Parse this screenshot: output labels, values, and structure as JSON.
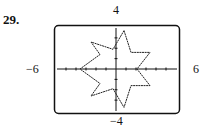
{
  "problem_number": "29.",
  "window": {
    "xmin": "−6",
    "xmax": "6",
    "ymin": "−4",
    "ymax": "4"
  },
  "chart_data": {
    "type": "line",
    "title": "",
    "xlabel": "",
    "ylabel": "",
    "xlim": [
      -6,
      6
    ],
    "ylim": [
      -4,
      4
    ],
    "tick_labels": {
      "left": "-6",
      "right": "6",
      "top": "4",
      "bottom": "-4"
    },
    "grid": false,
    "series": [
      {
        "name": "curve",
        "points": [
          [
            0.8,
            3.7
          ],
          [
            -0.3,
            1.9
          ],
          [
            -2.5,
            2.6
          ],
          [
            -1.6,
            1.4
          ],
          [
            -3.6,
            0.0
          ],
          [
            -1.6,
            -1.4
          ],
          [
            -2.5,
            -2.6
          ],
          [
            -0.3,
            -1.9
          ],
          [
            0.8,
            -3.7
          ],
          [
            1.5,
            -1.6
          ],
          [
            3.4,
            -1.6
          ],
          [
            2.1,
            0.0
          ],
          [
            3.4,
            1.6
          ],
          [
            1.5,
            1.6
          ],
          [
            0.8,
            3.7
          ]
        ]
      }
    ]
  }
}
